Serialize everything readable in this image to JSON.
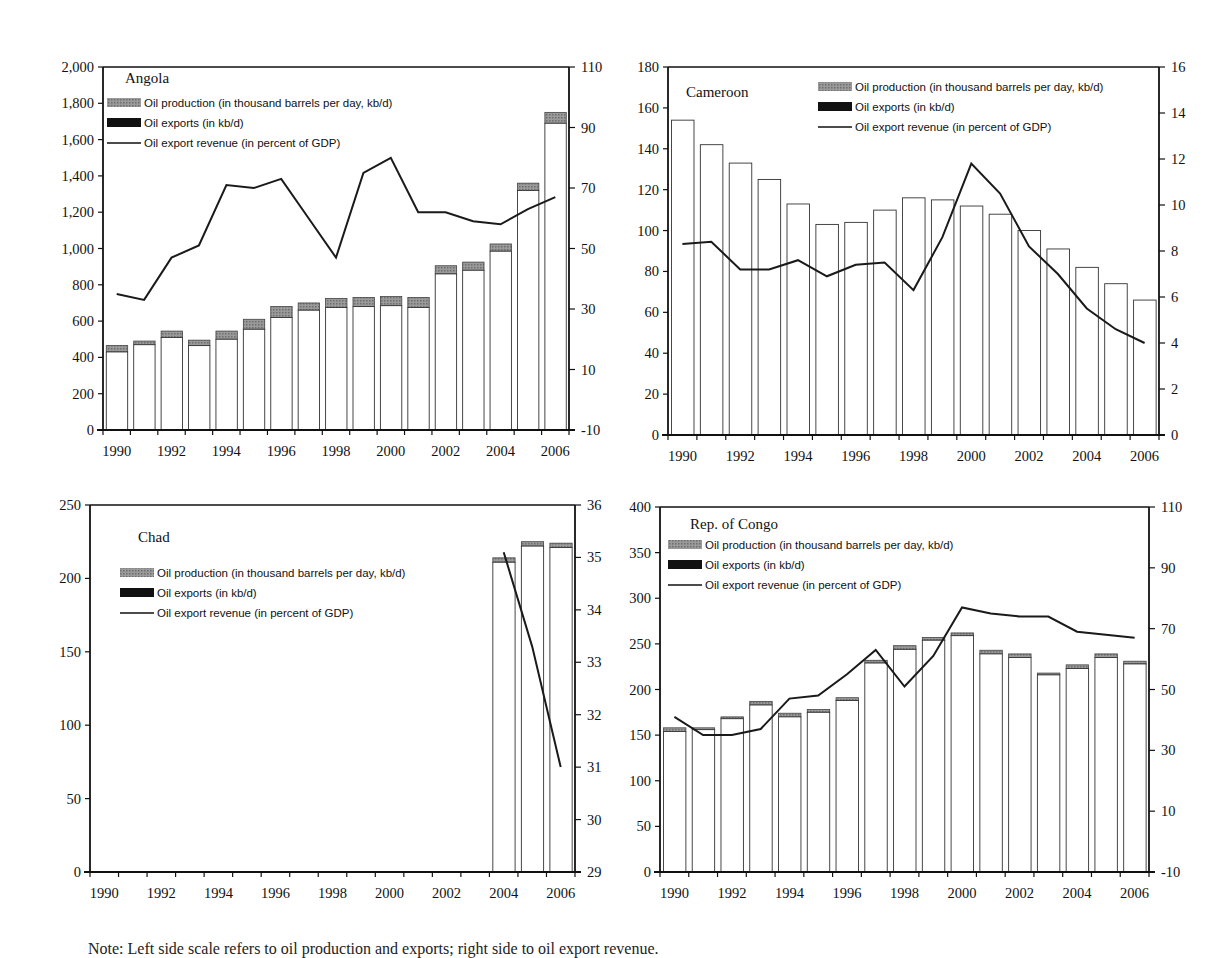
{
  "legend": {
    "production": "Oil production (in thousand barrels per day, kb/d)",
    "exports": "Oil exports (in kb/d)",
    "revenue": "Oil export revenue (in percent of GDP)"
  },
  "note": "Note: Left side scale refers to oil production and exports; right side to oil export revenue.",
  "colors": {
    "production": "#8c8c8c",
    "exports": "#ffffff",
    "line": "#1a1a1a",
    "axis": "#111111"
  },
  "chart_data": [
    {
      "type": "bar+line",
      "title": "Angola",
      "categories": [
        "1990",
        "1991",
        "1992",
        "1993",
        "1994",
        "1995",
        "1996",
        "1997",
        "1998",
        "1999",
        "2000",
        "2001",
        "2002",
        "2003",
        "2004",
        "2005",
        "2006"
      ],
      "xtick_labels": [
        "1990",
        "1992",
        "1994",
        "1996",
        "1998",
        "2000",
        "2002",
        "2004",
        "2006"
      ],
      "ylim": [
        0,
        2000
      ],
      "y_ticks": [
        0,
        200,
        400,
        600,
        800,
        1000,
        1200,
        1400,
        1600,
        1800,
        2000
      ],
      "y_tick_labels": [
        "0",
        "200",
        "400",
        "600",
        "800",
        "1,000",
        "1,200",
        "1,400",
        "1,600",
        "1,800",
        "2,000"
      ],
      "y2lim": [
        -10,
        110
      ],
      "y2_ticks": [
        -10,
        10,
        30,
        50,
        70,
        90,
        110
      ],
      "ylabel": "kb/d",
      "y2label": "percent of GDP",
      "series": [
        {
          "name": "Oil production (in thousand barrels per day, kb/d)",
          "axis": "left",
          "values": [
            465,
            490,
            545,
            495,
            545,
            610,
            680,
            700,
            725,
            730,
            735,
            730,
            905,
            925,
            1025,
            1360,
            1750
          ]
        },
        {
          "name": "Oil exports (in kb/d)",
          "axis": "left",
          "values": [
            430,
            470,
            510,
            465,
            500,
            555,
            620,
            660,
            675,
            680,
            685,
            675,
            860,
            880,
            985,
            1320,
            1690
          ]
        },
        {
          "name": "Oil export revenue (in percent of GDP)",
          "axis": "right",
          "values": [
            35,
            33,
            47,
            51,
            71,
            70,
            73,
            60,
            47,
            75,
            80,
            62,
            62,
            59,
            58,
            63,
            67
          ]
        }
      ],
      "legend_position": "upper-left",
      "layout": {
        "x": 103,
        "y": 67,
        "w": 466,
        "h": 363,
        "title_x": 22,
        "title_y": 16,
        "legend_x": 4,
        "legend_y": 38
      }
    },
    {
      "type": "bar+line",
      "title": "Cameroon",
      "categories": [
        "1990",
        "1991",
        "1992",
        "1993",
        "1994",
        "1995",
        "1996",
        "1997",
        "1998",
        "1999",
        "2000",
        "2001",
        "2002",
        "2003",
        "2004",
        "2005",
        "2006"
      ],
      "xtick_labels": [
        "1990",
        "1992",
        "1994",
        "1996",
        "1998",
        "2000",
        "2002",
        "2004",
        "2006"
      ],
      "ylim": [
        0,
        180
      ],
      "y_ticks": [
        0,
        20,
        40,
        60,
        80,
        100,
        120,
        140,
        160,
        180
      ],
      "y_tick_labels": [
        "0",
        "20",
        "40",
        "60",
        "80",
        "100",
        "120",
        "140",
        "160",
        "180"
      ],
      "y2lim": [
        0,
        16
      ],
      "y2_ticks": [
        0,
        2,
        4,
        6,
        8,
        10,
        12,
        14,
        16
      ],
      "ylabel": "kb/d",
      "y2label": "percent of GDP",
      "series": [
        {
          "name": "Oil production (in thousand barrels per day, kb/d)",
          "axis": "left",
          "values": [
            154,
            142,
            133,
            125,
            113,
            103,
            104,
            110,
            116,
            115,
            112,
            108,
            100,
            91,
            82,
            74,
            66
          ]
        },
        {
          "name": "Oil exports (in kb/d)",
          "axis": "left",
          "values": [
            154,
            142,
            133,
            125,
            113,
            103,
            104,
            110,
            116,
            115,
            112,
            108,
            100,
            91,
            82,
            74,
            66
          ]
        },
        {
          "name": "Oil export revenue (in percent of GDP)",
          "axis": "right",
          "values": [
            8.3,
            8.4,
            7.2,
            7.2,
            7.6,
            6.9,
            7.4,
            7.5,
            6.3,
            8.6,
            11.8,
            10.5,
            8.2,
            7.0,
            5.5,
            4.6,
            4.0
          ]
        }
      ],
      "legend_position": "upper-right",
      "layout": {
        "x": 668,
        "y": 67,
        "w": 491,
        "h": 368,
        "title_x": 18,
        "title_y": 30,
        "legend_x": 150,
        "legend_y": 22
      }
    },
    {
      "type": "bar+line",
      "title": "Chad",
      "categories": [
        "1990",
        "1991",
        "1992",
        "1993",
        "1994",
        "1995",
        "1996",
        "1997",
        "1998",
        "1999",
        "2000",
        "2001",
        "2002",
        "2003",
        "2004",
        "2005",
        "2006"
      ],
      "xtick_labels": [
        "1990",
        "1992",
        "1994",
        "1996",
        "1998",
        "2000",
        "2002",
        "2004",
        "2006"
      ],
      "ylim": [
        0,
        250
      ],
      "y_ticks": [
        0,
        50,
        100,
        150,
        200,
        250
      ],
      "y_tick_labels": [
        "0",
        "50",
        "100",
        "150",
        "200",
        "250"
      ],
      "y2lim": [
        29,
        36
      ],
      "y2_ticks": [
        29,
        30,
        31,
        32,
        33,
        34,
        35,
        36
      ],
      "ylabel": "kb/d",
      "y2label": "percent of GDP",
      "series": [
        {
          "name": "Oil production (in thousand barrels per day, kb/d)",
          "axis": "left",
          "values": [
            null,
            null,
            null,
            null,
            null,
            null,
            null,
            null,
            null,
            null,
            null,
            null,
            null,
            null,
            214,
            225,
            224
          ]
        },
        {
          "name": "Oil exports (in kb/d)",
          "axis": "left",
          "values": [
            null,
            null,
            null,
            null,
            null,
            null,
            null,
            null,
            null,
            null,
            null,
            null,
            null,
            null,
            211,
            222,
            221
          ]
        },
        {
          "name": "Oil export revenue (in percent of GDP)",
          "axis": "right",
          "values": [
            null,
            null,
            null,
            null,
            null,
            null,
            null,
            null,
            null,
            null,
            null,
            null,
            null,
            null,
            35.1,
            33.3,
            31.0
          ]
        }
      ],
      "legend_position": "upper-left",
      "layout": {
        "x": 90,
        "y": 505,
        "w": 485,
        "h": 367,
        "title_x": 48,
        "title_y": 37,
        "legend_x": 30,
        "legend_y": 70
      }
    },
    {
      "type": "bar+line",
      "title": "Rep. of Congo",
      "categories": [
        "1990",
        "1991",
        "1992",
        "1993",
        "1994",
        "1995",
        "1996",
        "1997",
        "1998",
        "1999",
        "2000",
        "2001",
        "2002",
        "2003",
        "2004",
        "2005",
        "2006"
      ],
      "xtick_labels": [
        "1990",
        "1992",
        "1994",
        "1996",
        "1998",
        "2000",
        "2002",
        "2004",
        "2006"
      ],
      "ylim": [
        0,
        400
      ],
      "y_ticks": [
        0,
        50,
        100,
        150,
        200,
        250,
        300,
        350,
        400
      ],
      "y_tick_labels": [
        "0",
        "50",
        "100",
        "150",
        "200",
        "250",
        "300",
        "350",
        "400"
      ],
      "y2lim": [
        -10,
        110
      ],
      "y2_ticks": [
        -10,
        10,
        30,
        50,
        70,
        90,
        110
      ],
      "ylabel": "kb/d",
      "y2label": "percent of GDP",
      "series": [
        {
          "name": "Oil production (in thousand barrels per day, kb/d)",
          "axis": "left",
          "values": [
            158,
            158,
            170,
            187,
            174,
            178,
            191,
            232,
            248,
            257,
            262,
            243,
            239,
            218,
            227,
            239,
            231
          ]
        },
        {
          "name": "Oil exports (in kb/d)",
          "axis": "left",
          "values": [
            154,
            156,
            168,
            183,
            170,
            175,
            188,
            229,
            244,
            254,
            259,
            239,
            235,
            216,
            223,
            235,
            228
          ]
        },
        {
          "name": "Oil export revenue (in percent of GDP)",
          "axis": "right",
          "values": [
            41,
            35,
            35,
            37,
            47,
            48,
            55,
            63,
            51,
            61,
            77,
            75,
            74,
            74,
            69,
            68,
            67
          ]
        }
      ],
      "legend_position": "upper-left",
      "layout": {
        "x": 660,
        "y": 507,
        "w": 489,
        "h": 365,
        "title_x": 30,
        "title_y": 22,
        "legend_x": 8,
        "legend_y": 40
      }
    }
  ]
}
